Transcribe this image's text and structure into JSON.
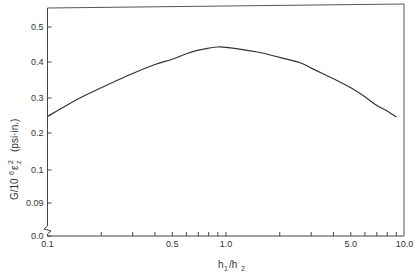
{
  "chart_data": {
    "type": "line",
    "title": "",
    "xlabel": "h1/h2",
    "ylabel": "G/10^6 εz^2 (psi·in.)",
    "xscale": "log",
    "xlim": [
      0.1,
      10.0
    ],
    "ylim": [
      0.0,
      0.55
    ],
    "grid": false,
    "legend": null,
    "x_ticks": [
      {
        "value": 0.1,
        "label": "0.1"
      },
      {
        "value": 0.2,
        "label": ""
      },
      {
        "value": 0.3,
        "label": ""
      },
      {
        "value": 0.4,
        "label": ""
      },
      {
        "value": 0.5,
        "label": "0.5"
      },
      {
        "value": 0.6,
        "label": ""
      },
      {
        "value": 0.7,
        "label": ""
      },
      {
        "value": 0.8,
        "label": ""
      },
      {
        "value": 0.9,
        "label": ""
      },
      {
        "value": 1.0,
        "label": "1.0"
      },
      {
        "value": 2.0,
        "label": ""
      },
      {
        "value": 3.0,
        "label": ""
      },
      {
        "value": 4.0,
        "label": ""
      },
      {
        "value": 5.0,
        "label": "5.0"
      },
      {
        "value": 6.0,
        "label": ""
      },
      {
        "value": 7.0,
        "label": ""
      },
      {
        "value": 8.0,
        "label": ""
      },
      {
        "value": 9.0,
        "label": ""
      },
      {
        "value": 10.0,
        "label": "10.0"
      }
    ],
    "y_ticks": [
      {
        "label": "0.5",
        "py": 27
      },
      {
        "label": "0.4",
        "py": 62
      },
      {
        "label": "0.3",
        "py": 98
      },
      {
        "label": "0.2",
        "py": 133
      },
      {
        "label": "0.1",
        "py": 170
      },
      {
        "label": "0.09",
        "py": 203
      },
      {
        "label": "0.0",
        "py": 236
      }
    ],
    "axis_break": "y-axis broken between 0.09 and 0.0",
    "series": [
      {
        "name": "G/10^6 εz^2",
        "x": [
          0.1,
          0.15,
          0.2,
          0.3,
          0.4,
          0.5,
          0.6,
          0.7,
          0.8,
          0.9,
          1.0,
          1.5,
          2.0,
          2.6,
          3.0,
          4.0,
          5.0,
          6.0,
          7.0,
          8.0,
          9.0
        ],
        "y": [
          0.25,
          0.3,
          0.33,
          0.37,
          0.395,
          0.41,
          0.425,
          0.435,
          0.441,
          0.444,
          0.443,
          0.43,
          0.415,
          0.4,
          0.385,
          0.355,
          0.33,
          0.305,
          0.28,
          0.265,
          0.248
        ]
      }
    ]
  }
}
